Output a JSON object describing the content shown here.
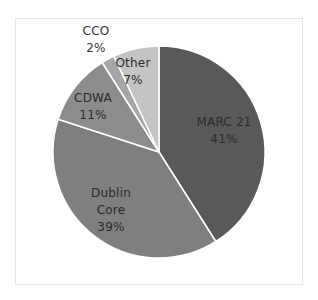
{
  "chart_data": {
    "type": "pie",
    "title": "",
    "categories": [
      "MARC 21",
      "Dublin Core",
      "CDWA",
      "CCO",
      "Other"
    ],
    "values": [
      41,
      39,
      11,
      2,
      7
    ],
    "unit": "%",
    "start_angle": "12 o'clock, clockwise",
    "colors": [
      "#595959",
      "#7f7f7f",
      "#8c8c8c",
      "#a6a6a6",
      "#c4c4c4"
    ],
    "labels": [
      {
        "name": "MARC 21",
        "lines": [
          "MARC 21"
        ],
        "pct": "41%"
      },
      {
        "name": "Dublin Core",
        "lines": [
          "Dublin",
          "Core"
        ],
        "pct": "39%"
      },
      {
        "name": "CDWA",
        "lines": [
          "CDWA"
        ],
        "pct": "11%"
      },
      {
        "name": "CCO",
        "lines": [
          "CCO"
        ],
        "pct": "2%"
      },
      {
        "name": "Other",
        "lines": [
          "Other"
        ],
        "pct": "7%"
      }
    ],
    "legend": "none (data labels on slices)",
    "slice_separator_color": "#ffffff"
  }
}
